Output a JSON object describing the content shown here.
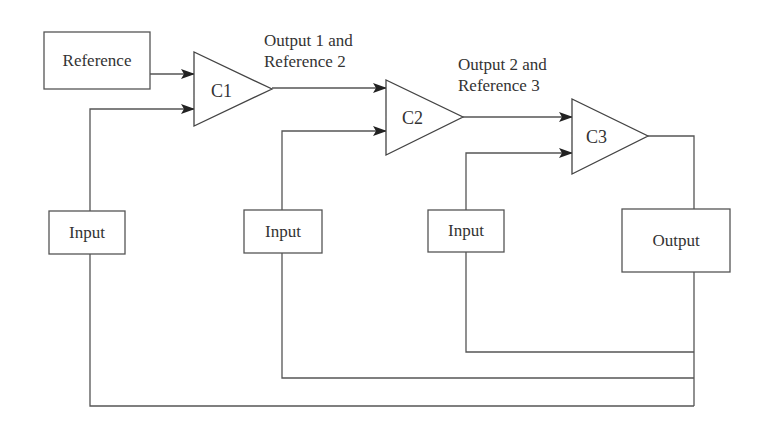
{
  "diagram": {
    "type": "cascaded-comparator-block-diagram",
    "colors": {
      "line": "#555555",
      "text": "#333333",
      "background": "#ffffff"
    },
    "blocks": {
      "reference": {
        "label": "Reference"
      },
      "input1": {
        "label": "Input"
      },
      "input2": {
        "label": "Input"
      },
      "input3": {
        "label": "Input"
      },
      "output": {
        "label": "Output"
      }
    },
    "comparators": [
      {
        "id": "c1",
        "label": "C1"
      },
      {
        "id": "c2",
        "label": "C2"
      },
      {
        "id": "c3",
        "label": "C3"
      }
    ],
    "edge_labels": {
      "c1_to_c2": {
        "line1": "Output 1 and",
        "line2": "Reference 2"
      },
      "c2_to_c3": {
        "line1": "Output 2 and",
        "line2": "Reference 3"
      }
    },
    "connections": [
      {
        "from": "Reference",
        "to": "C1",
        "arrow": true
      },
      {
        "from": "Input 1",
        "to": "C1",
        "arrow": true
      },
      {
        "from": "C1",
        "to": "C2",
        "arrow": true,
        "label": "Output 1 and Reference 2"
      },
      {
        "from": "Input 2",
        "to": "C2",
        "arrow": true
      },
      {
        "from": "C2",
        "to": "C3",
        "arrow": true,
        "label": "Output 2 and Reference 3"
      },
      {
        "from": "Input 3",
        "to": "C3",
        "arrow": true
      },
      {
        "from": "C3",
        "to": "Output",
        "arrow": false
      },
      {
        "from": "Output",
        "to": "Input 3",
        "arrow": false,
        "feedback": true
      },
      {
        "from": "Output",
        "to": "Input 2",
        "arrow": false,
        "feedback": true
      },
      {
        "from": "Output",
        "to": "Input 1",
        "arrow": false,
        "feedback": true
      }
    ]
  }
}
